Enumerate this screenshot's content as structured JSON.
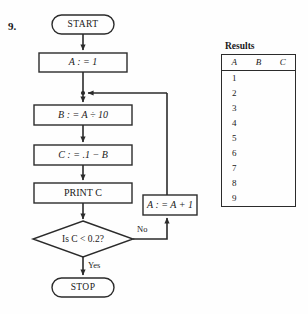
{
  "problem": {
    "number": "9."
  },
  "flowchart": {
    "nodes": {
      "start": "START",
      "init_a": "A : = 1",
      "compute_b": "B : = A ÷ 10",
      "compute_c": "C : = .1 − B",
      "print_c": "PRINT C",
      "decision": "Is C < 0.2?",
      "increment_a": "A : = A + 1",
      "stop": "STOP"
    },
    "branch_labels": {
      "yes": "Yes",
      "no": "No"
    }
  },
  "results": {
    "title": "Results",
    "columns": [
      "A",
      "B",
      "C"
    ],
    "rows": [
      {
        "a": "1",
        "b": "",
        "c": ""
      },
      {
        "a": "2",
        "b": "",
        "c": ""
      },
      {
        "a": "3",
        "b": "",
        "c": ""
      },
      {
        "a": "4",
        "b": "",
        "c": ""
      },
      {
        "a": "5",
        "b": "",
        "c": ""
      },
      {
        "a": "6",
        "b": "",
        "c": ""
      },
      {
        "a": "7",
        "b": "",
        "c": ""
      },
      {
        "a": "8",
        "b": "",
        "c": ""
      },
      {
        "a": "9",
        "b": "",
        "c": ""
      }
    ]
  },
  "colors": {
    "ink": "#2b2b2b",
    "paper": "#fefefe"
  }
}
